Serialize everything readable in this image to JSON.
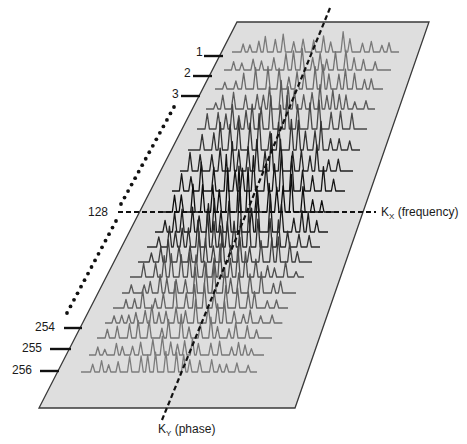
{
  "figure": {
    "type": "k-space-diagram",
    "plane": {
      "corners": [
        [
          237,
          22
        ],
        [
          429,
          22
        ],
        [
          295,
          408
        ],
        [
          39,
          408
        ]
      ],
      "fill": "#dedede",
      "stroke": "#3a3a3a"
    },
    "row_labels": [
      {
        "text": "1",
        "x": 196,
        "y": 56,
        "tick": [
          204,
          56,
          223,
          56
        ]
      },
      {
        "text": "2",
        "x": 184,
        "y": 77,
        "tick": [
          193,
          76,
          212,
          76
        ]
      },
      {
        "text": "3",
        "x": 172,
        "y": 98,
        "tick": [
          181,
          96,
          200,
          96
        ]
      },
      {
        "text": "128",
        "x": 88,
        "y": 216
      },
      {
        "text": "254",
        "x": 35,
        "y": 331,
        "tick": [
          64,
          328,
          82,
          328
        ]
      },
      {
        "text": "255",
        "x": 22,
        "y": 352,
        "tick": [
          50,
          349,
          71,
          349
        ]
      },
      {
        "text": "256",
        "x": 12,
        "y": 374,
        "tick": [
          40,
          371,
          59,
          371
        ]
      }
    ],
    "dotted_line": {
      "segments": [
        [
          [
            174,
            107
          ],
          [
            121,
            204
          ]
        ],
        [
          [
            116,
            221
          ],
          [
            67,
            313
          ]
        ]
      ],
      "color": "#111111"
    },
    "kx_axis": {
      "label_main": "K",
      "label_sub": "X",
      "label_rest": " (frequency)",
      "x1": 118,
      "y": 212,
      "x2": 376,
      "label_x": 381,
      "label_y": 216
    },
    "ky_axis": {
      "label_main": "K",
      "label_sub": "Y",
      "label_rest": " (phase)",
      "x1": 330,
      "y1": 8,
      "x2": 162,
      "y2": 420,
      "label_x": 158,
      "label_y": 433
    },
    "trace_rows": [
      {
        "baseline": 52,
        "x_start": 232,
        "x_end": 399,
        "amp": 22,
        "color": "#7a7a7a"
      },
      {
        "baseline": 70,
        "x_start": 224,
        "x_end": 391,
        "amp": 24,
        "color": "#737373"
      },
      {
        "baseline": 89,
        "x_start": 215,
        "x_end": 383,
        "amp": 26,
        "color": "#6a6a6a"
      },
      {
        "baseline": 109,
        "x_start": 206,
        "x_end": 375,
        "amp": 30,
        "color": "#5a5a5a"
      },
      {
        "baseline": 129,
        "x_start": 197,
        "x_end": 367,
        "amp": 34,
        "color": "#484848"
      },
      {
        "baseline": 150,
        "x_start": 188,
        "x_end": 360,
        "amp": 38,
        "color": "#333333"
      },
      {
        "baseline": 171,
        "x_start": 180,
        "x_end": 353,
        "amp": 42,
        "color": "#222222"
      },
      {
        "baseline": 191,
        "x_start": 172,
        "x_end": 345,
        "amp": 44,
        "color": "#161616"
      },
      {
        "baseline": 212,
        "x_start": 163,
        "x_end": 336,
        "amp": 46,
        "color": "#0c0c0c"
      },
      {
        "baseline": 232,
        "x_start": 155,
        "x_end": 328,
        "amp": 44,
        "color": "#1a1a1a"
      },
      {
        "baseline": 247,
        "x_start": 147,
        "x_end": 320,
        "amp": 40,
        "color": "#2c2c2c"
      },
      {
        "baseline": 262,
        "x_start": 138,
        "x_end": 312,
        "amp": 36,
        "color": "#3e3e3e"
      },
      {
        "baseline": 277,
        "x_start": 130,
        "x_end": 304,
        "amp": 32,
        "color": "#4e4e4e"
      },
      {
        "baseline": 293,
        "x_start": 122,
        "x_end": 296,
        "amp": 30,
        "color": "#5a5a5a"
      },
      {
        "baseline": 308,
        "x_start": 113,
        "x_end": 288,
        "amp": 27,
        "color": "#646464"
      },
      {
        "baseline": 323,
        "x_start": 105,
        "x_end": 280,
        "amp": 25,
        "color": "#6c6c6c"
      },
      {
        "baseline": 338,
        "x_start": 97,
        "x_end": 272,
        "amp": 23,
        "color": "#727272"
      },
      {
        "baseline": 355,
        "x_start": 89,
        "x_end": 264,
        "amp": 21,
        "color": "#787878"
      },
      {
        "baseline": 372,
        "x_start": 81,
        "x_end": 257,
        "amp": 20,
        "color": "#7c7c7c"
      }
    ]
  }
}
